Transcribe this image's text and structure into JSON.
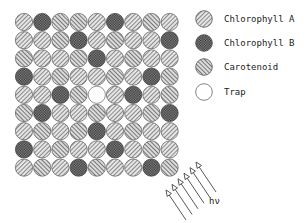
{
  "pigment_types": {
    "A": {
      "label": "Chlorophyll A",
      "pattern": "hatch-forward"
    },
    "B": {
      "label": "Chlorophyll B",
      "pattern": "crosshatch-dark"
    },
    "C": {
      "label": "Carotenoid",
      "pattern": "hatch-back"
    },
    "T": {
      "label": "Trap",
      "pattern": "empty"
    }
  },
  "legend": [
    {
      "key": "A",
      "label": "Chlorophyll A"
    },
    {
      "key": "B",
      "label": "Chlorophyll B"
    },
    {
      "key": "C",
      "label": "Carotenoid"
    },
    {
      "key": "T",
      "label": "Trap"
    }
  ],
  "grid": {
    "rows": 9,
    "cols": 9,
    "cells": [
      [
        "A",
        "B",
        "C",
        "C",
        "A",
        "B",
        "A",
        "C",
        "A"
      ],
      [
        "A",
        "A",
        "C",
        "B",
        "A",
        "C",
        "A",
        "A",
        "B"
      ],
      [
        "C",
        "A",
        "A",
        "C",
        "B",
        "A",
        "C",
        "A",
        "A"
      ],
      [
        "B",
        "A",
        "C",
        "A",
        "A",
        "C",
        "A",
        "B",
        "C"
      ],
      [
        "A",
        "A",
        "B",
        "C",
        "T",
        "A",
        "B",
        "A",
        "C"
      ],
      [
        "C",
        "B",
        "A",
        "A",
        "C",
        "A",
        "A",
        "C",
        "B"
      ],
      [
        "A",
        "C",
        "A",
        "C",
        "B",
        "A",
        "C",
        "A",
        "A"
      ],
      [
        "B",
        "A",
        "C",
        "A",
        "A",
        "B",
        "A",
        "C",
        "A"
      ],
      [
        "A",
        "C",
        "A",
        "B",
        "C",
        "A",
        "A",
        "B",
        "C"
      ]
    ]
  },
  "light": {
    "label": "hν",
    "arrow_count": 6,
    "direction": "up-left"
  }
}
